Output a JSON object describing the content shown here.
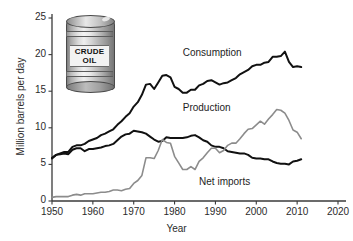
{
  "figure": {
    "background_color": "#ffffff",
    "caption_clipped": ""
  },
  "illustration": {
    "name": "crude-oil-barrel",
    "label_line1": "CRUDE",
    "label_line2": "OIL"
  },
  "chart_data": {
    "type": "line",
    "title": "",
    "subtitle": "",
    "xlabel": "Year",
    "ylabel": "Million barrels per day",
    "xlim": [
      1950,
      2020
    ],
    "ylim": [
      0,
      25
    ],
    "xticks": [
      1950,
      1960,
      1970,
      1980,
      1990,
      2000,
      2010,
      2020
    ],
    "xticklabels": [
      "1950",
      "1960",
      "1970",
      "1980",
      "1990",
      "2000",
      "2010",
      "2020"
    ],
    "yticks": [
      0,
      5,
      10,
      15,
      20,
      25
    ],
    "yticklabels": [
      "0",
      "5",
      "10",
      "15",
      "20",
      "25"
    ],
    "grid": false,
    "legend_position": "inline-annotations",
    "series": [
      {
        "name": "Consumption",
        "color": "#111111",
        "line_width": 2.0,
        "label_x": 1982,
        "label_y": 20.2,
        "x": [
          1950,
          1951,
          1952,
          1953,
          1954,
          1955,
          1956,
          1957,
          1958,
          1959,
          1960,
          1961,
          1962,
          1963,
          1964,
          1965,
          1966,
          1967,
          1968,
          1969,
          1970,
          1971,
          1972,
          1973,
          1974,
          1975,
          1976,
          1977,
          1978,
          1979,
          1980,
          1981,
          1982,
          1983,
          1984,
          1985,
          1986,
          1987,
          1988,
          1989,
          1990,
          1991,
          1992,
          1993,
          1994,
          1995,
          1996,
          1997,
          1998,
          1999,
          2000,
          2001,
          2002,
          2003,
          2004,
          2005,
          2006,
          2007,
          2008,
          2009,
          2010,
          2011
        ],
        "y": [
          5.8,
          6.3,
          6.5,
          6.7,
          6.7,
          7.4,
          7.6,
          7.6,
          7.8,
          8.2,
          8.4,
          8.6,
          9.0,
          9.2,
          9.5,
          9.8,
          10.4,
          10.9,
          11.5,
          12.0,
          12.9,
          13.5,
          14.5,
          15.9,
          16.0,
          15.3,
          16.2,
          17.1,
          17.2,
          16.9,
          15.6,
          15.3,
          14.8,
          14.8,
          15.2,
          15.2,
          15.8,
          16.0,
          16.4,
          16.5,
          16.2,
          15.9,
          16.1,
          16.2,
          16.5,
          16.8,
          17.3,
          17.6,
          17.9,
          18.4,
          18.6,
          18.6,
          18.9,
          19.0,
          19.7,
          19.7,
          19.8,
          20.4,
          19.0,
          18.3,
          18.4,
          18.3
        ]
      },
      {
        "name": "Production",
        "color": "#111111",
        "line_width": 2.0,
        "label_x": 1982,
        "label_y": 12.7,
        "x": [
          1950,
          1951,
          1952,
          1953,
          1954,
          1955,
          1956,
          1957,
          1958,
          1959,
          1960,
          1961,
          1962,
          1963,
          1964,
          1965,
          1966,
          1967,
          1968,
          1969,
          1970,
          1971,
          1972,
          1973,
          1974,
          1975,
          1976,
          1977,
          1978,
          1979,
          1980,
          1981,
          1982,
          1983,
          1984,
          1985,
          1986,
          1987,
          1988,
          1989,
          1990,
          1991,
          1992,
          1993,
          1994,
          1995,
          1996,
          1997,
          1998,
          1999,
          2000,
          2001,
          2002,
          2003,
          2004,
          2005,
          2006,
          2007,
          2008,
          2009,
          2010,
          2011
        ],
        "y": [
          5.9,
          6.3,
          6.4,
          6.5,
          6.4,
          7.0,
          7.2,
          7.2,
          6.8,
          7.1,
          7.1,
          7.2,
          7.3,
          7.5,
          7.6,
          7.8,
          8.3,
          8.8,
          9.1,
          9.2,
          9.6,
          9.5,
          9.4,
          9.2,
          8.8,
          8.4,
          8.1,
          8.2,
          8.7,
          8.6,
          8.6,
          8.6,
          8.6,
          8.7,
          8.9,
          9.0,
          8.7,
          8.3,
          8.1,
          7.6,
          7.4,
          7.4,
          7.2,
          6.8,
          6.7,
          6.6,
          6.5,
          6.5,
          6.3,
          5.9,
          5.8,
          5.8,
          5.7,
          5.7,
          5.4,
          5.2,
          5.1,
          5.1,
          5.0,
          5.4,
          5.5,
          5.7
        ]
      },
      {
        "name": "Net imports",
        "color": "#8c8c8c",
        "line_width": 1.6,
        "label_x": 1986,
        "label_y": 2.6,
        "x": [
          1950,
          1951,
          1952,
          1953,
          1954,
          1955,
          1956,
          1957,
          1958,
          1959,
          1960,
          1961,
          1962,
          1963,
          1964,
          1965,
          1966,
          1967,
          1968,
          1969,
          1970,
          1971,
          1972,
          1973,
          1974,
          1975,
          1976,
          1977,
          1978,
          1979,
          1980,
          1981,
          1982,
          1983,
          1984,
          1985,
          1986,
          1987,
          1988,
          1989,
          1990,
          1991,
          1992,
          1993,
          1994,
          1995,
          1996,
          1997,
          1998,
          1999,
          2000,
          2001,
          2002,
          2003,
          2004,
          2005,
          2006,
          2007,
          2008,
          2009,
          2010,
          2011
        ],
        "y": [
          0.5,
          0.6,
          0.6,
          0.6,
          0.6,
          0.8,
          0.9,
          0.8,
          1.0,
          1.0,
          1.0,
          1.1,
          1.2,
          1.2,
          1.3,
          1.5,
          1.5,
          1.4,
          1.6,
          1.7,
          2.4,
          2.8,
          3.5,
          5.9,
          5.9,
          5.8,
          6.9,
          8.4,
          8.0,
          7.9,
          6.1,
          5.2,
          4.3,
          4.3,
          4.7,
          4.3,
          5.4,
          5.9,
          6.6,
          7.2,
          7.2,
          6.6,
          6.9,
          7.6,
          7.9,
          7.9,
          8.5,
          9.2,
          9.8,
          9.9,
          10.4,
          10.9,
          10.5,
          11.2,
          11.8,
          12.5,
          12.4,
          12.0,
          11.0,
          9.7,
          9.4,
          8.5
        ]
      }
    ]
  },
  "axes": {
    "y_tick_label_0": "0",
    "y_tick_label_5": "5",
    "y_tick_label_10": "10",
    "y_tick_label_15": "15",
    "y_tick_label_20": "20",
    "y_tick_label_25": "25",
    "x_tick_label_1950": "1950",
    "x_tick_label_1960": "1960",
    "x_tick_label_1970": "1970",
    "x_tick_label_1980": "1980",
    "x_tick_label_1990": "1990",
    "x_tick_label_2000": "2000",
    "x_tick_label_2010": "2010",
    "x_tick_label_2020": "2020"
  },
  "annotations": {
    "consumption": "Consumption",
    "production": "Production",
    "net_imports": "Net imports"
  }
}
